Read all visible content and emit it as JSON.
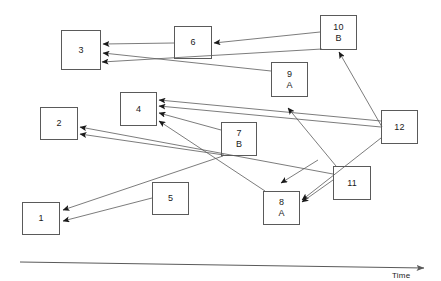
{
  "diagram": {
    "type": "event-sequence-timeline-diagram",
    "canvas": {
      "width": 441,
      "height": 281
    },
    "stroke_color": "#5a5a5a",
    "arrow_color": "#1a1a1a",
    "background": "#ffffff",
    "axis": {
      "label": "Time",
      "label_x": 392,
      "label_y": 271,
      "x1": 20,
      "y1": 262,
      "x2": 424,
      "y2": 268
    },
    "nodes": [
      {
        "id": "1",
        "primary": "1",
        "secondary": "",
        "x": 22,
        "y": 202,
        "w": 38,
        "h": 33
      },
      {
        "id": "2",
        "primary": "2",
        "secondary": "",
        "x": 40,
        "y": 107,
        "w": 38,
        "h": 33
      },
      {
        "id": "3",
        "primary": "3",
        "secondary": "",
        "x": 61,
        "y": 30,
        "w": 40,
        "h": 40
      },
      {
        "id": "4",
        "primary": "4",
        "secondary": "",
        "x": 120,
        "y": 92,
        "w": 37,
        "h": 34
      },
      {
        "id": "5",
        "primary": "5",
        "secondary": "",
        "x": 152,
        "y": 182,
        "w": 37,
        "h": 33
      },
      {
        "id": "6",
        "primary": "6",
        "secondary": "",
        "x": 174,
        "y": 26,
        "w": 38,
        "h": 33
      },
      {
        "id": "7",
        "primary": "7",
        "secondary": "B",
        "x": 221,
        "y": 122,
        "w": 36,
        "h": 34
      },
      {
        "id": "8",
        "primary": "8",
        "secondary": "A",
        "x": 263,
        "y": 191,
        "w": 37,
        "h": 34
      },
      {
        "id": "9",
        "primary": "9",
        "secondary": "A",
        "x": 271,
        "y": 62,
        "w": 37,
        "h": 35
      },
      {
        "id": "10",
        "primary": "10",
        "secondary": "B",
        "x": 320,
        "y": 15,
        "w": 37,
        "h": 35
      },
      {
        "id": "11",
        "primary": "11",
        "secondary": "",
        "x": 333,
        "y": 166,
        "w": 38,
        "h": 34
      },
      {
        "id": "12",
        "primary": "12",
        "secondary": "",
        "x": 381,
        "y": 110,
        "w": 37,
        "h": 34
      }
    ],
    "edges": [
      {
        "from": "6",
        "to": "3",
        "x1": 174,
        "y1": 43,
        "x2": 103,
        "y2": 44
      },
      {
        "from": "10",
        "to": "6",
        "x1": 320,
        "y1": 32,
        "x2": 214,
        "y2": 43
      },
      {
        "from": "9",
        "to": "3",
        "x1": 271,
        "y1": 71,
        "x2": 103,
        "y2": 53
      },
      {
        "from": "10",
        "to": "8",
        "x1": 322,
        "y1": 49,
        "x2": 102,
        "y2": 62
      },
      {
        "from": "12",
        "to": "4",
        "x1": 381,
        "y1": 121,
        "x2": 159,
        "y2": 100
      },
      {
        "from": "12",
        "to": "4b",
        "x1": 381,
        "y1": 127,
        "x2": 159,
        "y2": 106
      },
      {
        "from": "7",
        "to": "4",
        "x1": 221,
        "y1": 130,
        "x2": 159,
        "y2": 113
      },
      {
        "from": "8",
        "to": "4",
        "x1": 265,
        "y1": 191,
        "x2": 159,
        "y2": 121
      },
      {
        "from": "11",
        "to": "2",
        "x1": 333,
        "y1": 174,
        "x2": 80,
        "y2": 127
      },
      {
        "from": "7b",
        "to": "2",
        "x1": 224,
        "y1": 155,
        "x2": 80,
        "y2": 134
      },
      {
        "from": "7c",
        "to": "1",
        "x1": 223,
        "y1": 156,
        "x2": 63,
        "y2": 210
      },
      {
        "from": "5",
        "to": "1",
        "x1": 152,
        "y1": 198,
        "x2": 63,
        "y2": 221
      },
      {
        "from": "12",
        "to": "8",
        "x1": 381,
        "y1": 138,
        "x2": 302,
        "y2": 200
      },
      {
        "from": "11",
        "to": "8",
        "x1": 333,
        "y1": 180,
        "x2": 302,
        "y2": 202
      },
      {
        "from": "12",
        "to": "10",
        "x1": 382,
        "y1": 127,
        "x2": 339,
        "y2": 52
      },
      {
        "from": "9b",
        "to": "mid",
        "x1": 318,
        "y1": 160,
        "x2": 281,
        "y2": 183
      },
      {
        "from": "11b",
        "to": "mid2",
        "x1": 336,
        "y1": 166,
        "x2": 288,
        "y2": 108
      }
    ]
  }
}
